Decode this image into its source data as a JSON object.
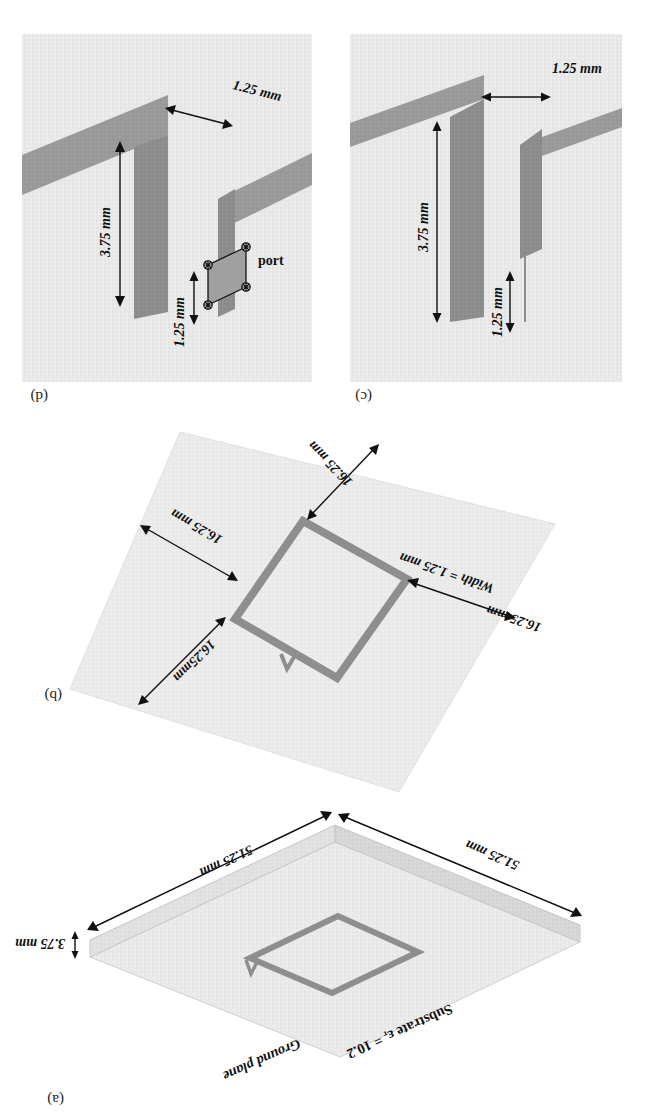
{
  "figure": {
    "type": "technical-diagram",
    "orientation_note": "scanned upside down (rotated 180 degrees)"
  },
  "panels": [
    {
      "id": "a",
      "label": "(a)",
      "title": "Substrate and ground plane perspective view",
      "annotations": {
        "substrate": "Substrate εᵣ = 10.2",
        "ground_plane": "Ground plane",
        "thickness": "3.75 mm",
        "side_left": "51.25 mm",
        "side_right": "51.25 mm"
      }
    },
    {
      "id": "b",
      "label": "(b)",
      "title": "Square loop top view with dimensions",
      "annotations": {
        "width": "Width = 1.25 mm",
        "top_left": "16.25 mm",
        "top_right": "16.25mm",
        "bottom_right": "16.25 mm",
        "bottom_left": "16.25 mm"
      }
    },
    {
      "id": "c",
      "label": "(c)",
      "title": "Close-up of the loop gap",
      "annotations": {
        "gap": "1.25 mm",
        "height": "3.75 mm",
        "depth": "1.25 mm"
      }
    },
    {
      "id": "d",
      "label": "(d)",
      "title": "Close-up of the excitation port",
      "annotations": {
        "gap": "1.25 mm",
        "height": "3.75 mm",
        "depth": "1.25 mm",
        "port": "port"
      }
    }
  ],
  "colors": {
    "substrate": "#ebebeb",
    "metal": "#9c9c9c",
    "metal_dark": "#8a8a8a",
    "line": "#111111",
    "background": "#ffffff"
  }
}
